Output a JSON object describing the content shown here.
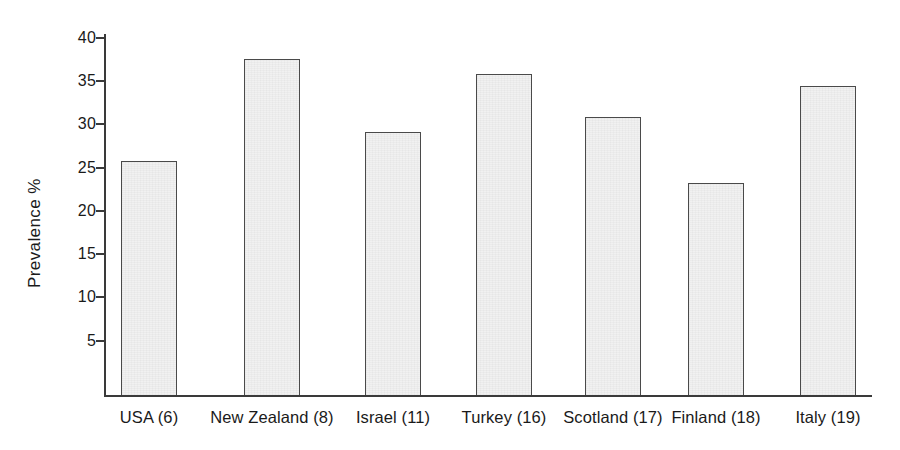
{
  "chart_data": {
    "type": "bar",
    "title": "",
    "xlabel": "",
    "ylabel": "Prevalence %",
    "categories": [
      "USA (6)",
      "New Zealand (8)",
      "Israel (11)",
      "Turkey (16)",
      "Scotland (17)",
      "Finland (18)",
      "Italy (19)"
    ],
    "values": [
      25.8,
      37.5,
      29.1,
      35.8,
      30.8,
      23.2,
      34.4
    ],
    "ylim": [
      0,
      41.5
    ],
    "yticks": [
      5,
      10,
      15,
      20,
      25,
      30,
      35,
      40
    ],
    "ytick_labels": [
      "5",
      "10",
      "15",
      "20",
      "25",
      "30",
      "35",
      "40"
    ],
    "grid": false,
    "legend": null,
    "bar_fill_color": "#f1f1f1",
    "bar_edge_color": "#4a4a4a",
    "axis_color": "#3a3a3a",
    "background_color": "#ffffff"
  }
}
